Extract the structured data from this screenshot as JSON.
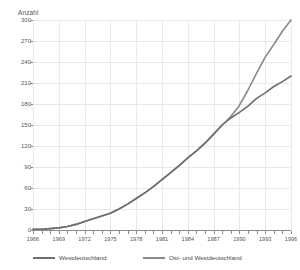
{
  "chart_data": {
    "type": "line",
    "title": "",
    "xlabel": "",
    "ylabel": "Anzahl",
    "ylim": [
      0,
      300
    ],
    "xlim": [
      1966,
      1996
    ],
    "ytick_step": 30,
    "yticks": [
      0,
      30,
      60,
      90,
      120,
      150,
      180,
      210,
      240,
      270,
      300
    ],
    "xticks_labeled": [
      1966,
      1969,
      1972,
      1975,
      1978,
      1981,
      1984,
      1987,
      1990,
      1993,
      1996
    ],
    "xtick_interval_minor": 1,
    "grid": true,
    "legend_position": "bottom",
    "x": [
      1966,
      1967,
      1968,
      1969,
      1970,
      1971,
      1972,
      1973,
      1974,
      1975,
      1976,
      1977,
      1978,
      1979,
      1980,
      1981,
      1982,
      1983,
      1984,
      1985,
      1986,
      1987,
      1988,
      1989,
      1990,
      1991,
      1992,
      1993,
      1994,
      1995,
      1996
    ],
    "series": [
      {
        "name": "Westdeutschland",
        "color": "#6e6e6e",
        "values": [
          1,
          1,
          2,
          3,
          5,
          8,
          12,
          16,
          20,
          24,
          30,
          37,
          45,
          53,
          62,
          72,
          82,
          92,
          103,
          113,
          124,
          137,
          150,
          160,
          168,
          177,
          188,
          196,
          205,
          212,
          220
        ]
      },
      {
        "name": "Ost- und Westdeutschland",
        "color": "#8a8a8a",
        "values": [
          1,
          1,
          2,
          3,
          5,
          8,
          12,
          16,
          20,
          24,
          30,
          37,
          45,
          53,
          62,
          72,
          82,
          92,
          103,
          113,
          124,
          137,
          150,
          162,
          178,
          200,
          224,
          247,
          265,
          284,
          300
        ]
      }
    ]
  },
  "legend": {
    "items": [
      {
        "label": "Westdeutschland"
      },
      {
        "label": "Ost- und Westdeutschland"
      }
    ]
  },
  "colors": {
    "grid": "#e9e9ec",
    "axis": "#8d8d8d",
    "text": "#555555",
    "series_west": "#6e6e6e",
    "series_total": "#8a8a8a"
  }
}
